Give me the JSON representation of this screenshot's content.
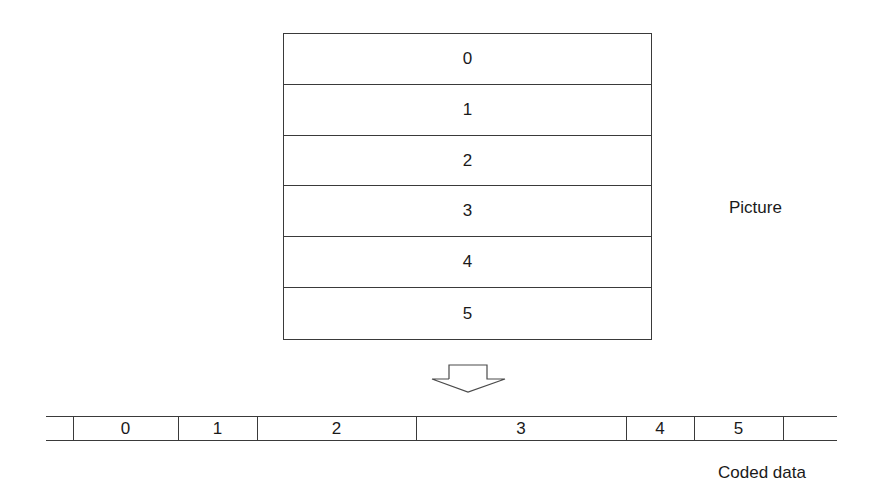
{
  "picture": {
    "label": "Picture",
    "rows": [
      "0",
      "1",
      "2",
      "3",
      "4",
      "5"
    ]
  },
  "arrow": {
    "icon": "hollow-down-arrow-icon"
  },
  "coded_data": {
    "label": "Coded data",
    "segments": [
      {
        "label": "0",
        "x0": 73,
        "x1": 178
      },
      {
        "label": "1",
        "x0": 178,
        "x1": 257
      },
      {
        "label": "2",
        "x0": 257,
        "x1": 416
      },
      {
        "label": "3",
        "x0": 416,
        "x1": 626
      },
      {
        "label": "4",
        "x0": 626,
        "x1": 694
      },
      {
        "label": "5",
        "x0": 694,
        "x1": 783
      }
    ],
    "strip_start": 46,
    "strip_end": 837
  }
}
